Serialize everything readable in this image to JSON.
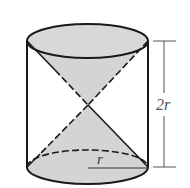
{
  "figure": {
    "colors": {
      "stroke": "#1a1a1a",
      "fill": "#d4d4d4",
      "background": "#ffffff",
      "dimension": "#555555"
    },
    "labels": {
      "height": "2r",
      "radius": "r"
    }
  }
}
